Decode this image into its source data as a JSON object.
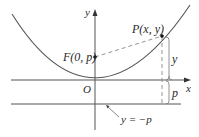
{
  "figure": {
    "type": "parabola-focus-directrix",
    "colors": {
      "curve": "#555555",
      "axes": "#555555",
      "dashed": "#888888",
      "text": "#2a2a2a",
      "point": "#111111"
    },
    "axes": {
      "x_label": "x",
      "y_label": "y",
      "origin_label": "O"
    },
    "focus": {
      "label": "F(0, p)",
      "coords": [
        0,
        "p"
      ]
    },
    "point": {
      "label": "P(x, y)",
      "coords": [
        "x",
        "y"
      ]
    },
    "directrix": {
      "label": "y = −p"
    },
    "distances": {
      "y_label": "y",
      "p_label": "p"
    }
  }
}
